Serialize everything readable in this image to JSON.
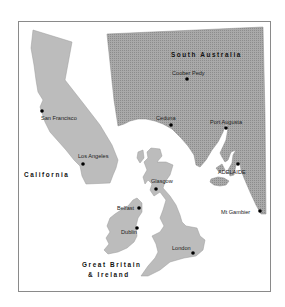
{
  "map": {
    "title": "Size comparison map",
    "colors": {
      "frame": "#8a8a8a",
      "land_light": "#bcbcbc",
      "land_dark": "#a6a6a6",
      "dot_pattern": "#8c8c8c",
      "city_marker": "#000000"
    },
    "regions": [
      {
        "id": "south-australia",
        "label": "South Australia",
        "cities": [
          "Coober Pedy",
          "Ceduna",
          "Port Augusta",
          "ADELAIDE",
          "Mt Gambier"
        ]
      },
      {
        "id": "california",
        "label": "California",
        "cities": [
          "San Francisco",
          "Los Angeles"
        ]
      },
      {
        "id": "great-britain-ireland",
        "label_line1": "Great Britain",
        "label_line2": "& Ireland",
        "cities": [
          "Glasgow",
          "Belfast",
          "Dublin",
          "London"
        ]
      }
    ]
  }
}
